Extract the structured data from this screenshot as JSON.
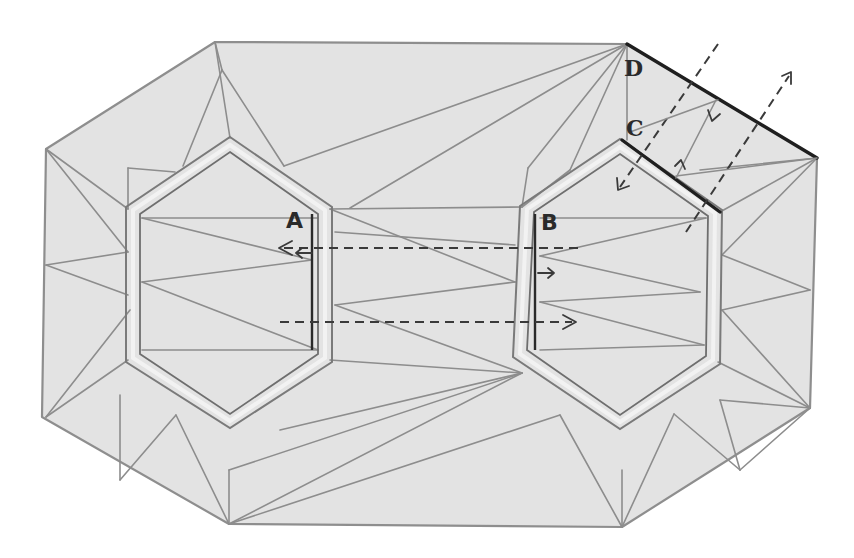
{
  "diagram": {
    "type": "origami crease pattern",
    "labels": [
      {
        "id": "A",
        "text": "A",
        "x": 286,
        "y": 210
      },
      {
        "id": "B",
        "text": "B",
        "x": 541,
        "y": 212
      },
      {
        "id": "C",
        "text": "C",
        "x": 628,
        "y": 119
      },
      {
        "id": "D",
        "text": "D",
        "x": 625,
        "y": 58
      }
    ],
    "colors": {
      "paper_fill": "#e3e3e3",
      "crease": "#8d8d8d",
      "bold_edge": "#1f1f1f",
      "background": "#ffffff"
    },
    "arrows": [
      {
        "name": "dashed-arrow-left-upper",
        "from": [
          578,
          248
        ],
        "to": [
          278,
          248
        ],
        "style": "dashed"
      },
      {
        "name": "dashed-arrow-right-lower",
        "from": [
          280,
          322
        ],
        "to": [
          576,
          322
        ],
        "style": "dashed"
      },
      {
        "name": "short-arrow-left-A",
        "from": [
          312,
          253
        ],
        "to": [
          296,
          253
        ],
        "style": "solid"
      },
      {
        "name": "short-arrow-right-B",
        "from": [
          538,
          273
        ],
        "to": [
          554,
          273
        ],
        "style": "solid"
      },
      {
        "name": "dashed-arrow-down-left-diagonal",
        "from": [
          720,
          44
        ],
        "to": [
          618,
          190
        ],
        "style": "dashed"
      },
      {
        "name": "dashed-arrow-up-right-diagonal",
        "from": [
          690,
          228
        ],
        "to": [
          790,
          72
        ],
        "style": "dashed"
      },
      {
        "name": "short-arrow-C-D-upper",
        "from": [
          712,
          108
        ],
        "to": [
          708,
          120
        ],
        "style": "solid"
      },
      {
        "name": "short-arrow-C-D-lower",
        "from": [
          676,
          176
        ],
        "to": [
          683,
          162
        ],
        "style": "solid"
      }
    ]
  }
}
